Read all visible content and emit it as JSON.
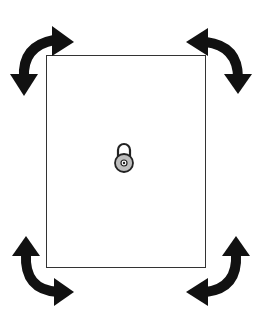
{
  "diagram": {
    "frame": {
      "description": "Rectangular panel outline",
      "border_color": "#333333"
    },
    "center_icon": {
      "name": "padlock-icon",
      "body_color": "#bdbdbd",
      "outline_color": "#222222"
    },
    "arrows": [
      {
        "position": "top-left",
        "name": "rotate-arrow-top-left",
        "color": "#111111"
      },
      {
        "position": "top-right",
        "name": "rotate-arrow-top-right",
        "color": "#111111"
      },
      {
        "position": "bottom-left",
        "name": "rotate-arrow-bottom-left",
        "color": "#111111"
      },
      {
        "position": "bottom-right",
        "name": "rotate-arrow-bottom-right",
        "color": "#111111"
      }
    ]
  }
}
